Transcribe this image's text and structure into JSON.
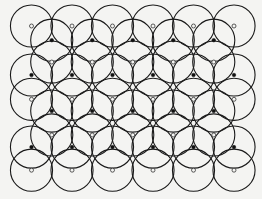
{
  "diagram": {
    "title": "",
    "colors": {
      "stroke": "#1a1a1a",
      "open_dot": "#f4f4f2",
      "filled_dot": "#111111",
      "background": "#f4f4f2"
    },
    "lattice": {
      "unit": "grid spacing between adjacent centers in a row = 1",
      "radius": 0.52,
      "rows": [
        {
          "row": 0,
          "offset": 0,
          "count": 6,
          "marker": "open"
        },
        {
          "row": 1,
          "offset": 0.5,
          "count": 5,
          "marker": "filled"
        },
        {
          "row": 2,
          "offset": 0.5,
          "count": 5,
          "marker": "open"
        },
        {
          "row": 3,
          "offset": 0,
          "count": 6,
          "marker": "filled"
        },
        {
          "row": 4,
          "offset": 0,
          "count": 6,
          "marker": "open"
        },
        {
          "row": 5,
          "offset": 0.5,
          "count": 5,
          "marker": "filled"
        },
        {
          "row": 6,
          "offset": 0.5,
          "count": 5,
          "marker": "open"
        },
        {
          "row": 7,
          "offset": 0,
          "count": 6,
          "marker": "filled"
        },
        {
          "row": 8,
          "offset": 0,
          "count": 6,
          "marker": "open"
        }
      ],
      "row_levels": [
        0,
        0.35,
        0.89,
        1.21,
        1.81,
        2.1,
        2.69,
        2.99,
        3.56
      ]
    }
  }
}
